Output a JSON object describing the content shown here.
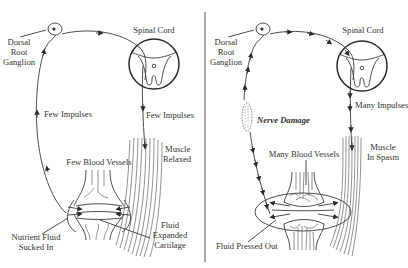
{
  "figure": {
    "top_caption_partial": "",
    "divider_color": "#555555",
    "ink_color": "#333333"
  },
  "panels": [
    {
      "id": "normal",
      "labels": {
        "ganglion": [
          "Dorsal",
          "Root",
          "Ganglion"
        ],
        "spinal_cord": "Spinal Cord",
        "afferent_impulses": "Few Impulses",
        "efferent_impulses": "Few Impulses",
        "blood_vessels": "Few Blood Vessels",
        "muscle": [
          "Muscle",
          "Relaxed"
        ],
        "fluid_in": [
          "Nutrient Fluid",
          "Sucked In"
        ],
        "cartilage": [
          "Fluid",
          "Expanded",
          "Cartilage"
        ]
      }
    },
    {
      "id": "damaged",
      "labels": {
        "ganglion": [
          "Dorsal",
          "Root",
          "Ganglion"
        ],
        "spinal_cord": "Spinal Cord",
        "nerve_damage": "Nerve Damage",
        "efferent_impulses": "Many Impulses",
        "blood_vessels": "Many Blood Vessels",
        "muscle": [
          "Muscle",
          "In Spasm"
        ],
        "fluid_out": "Fluid Pressed Out"
      }
    }
  ]
}
